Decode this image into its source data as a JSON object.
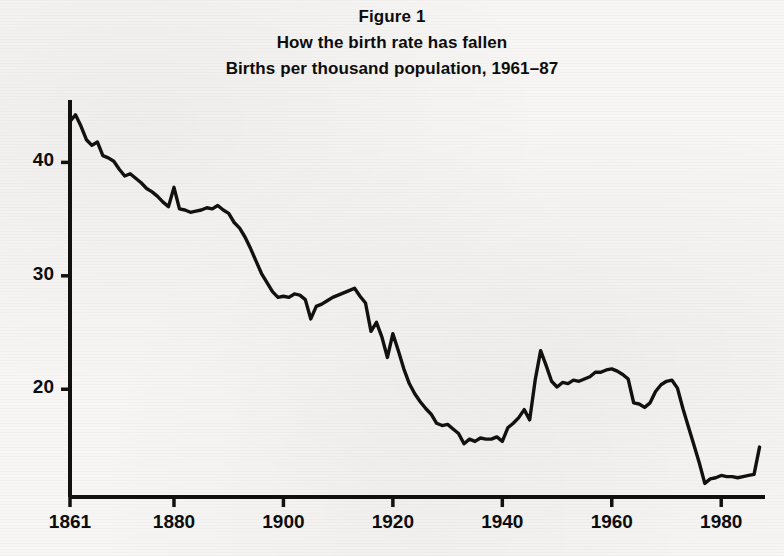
{
  "figure": {
    "title_lines": [
      "Figure 1",
      "How the birth rate has fallen",
      "Births per thousand population, 1961–87"
    ]
  },
  "axes": {
    "y_tick_labels": [
      "40",
      "30",
      "20"
    ],
    "x_tick_labels": [
      "1861",
      "1880",
      "1900",
      "1920",
      "1940",
      "1960",
      "1980"
    ]
  },
  "chart_data": {
    "type": "line",
    "subtitle": "Births per thousand population, 1961–87",
    "xlabel": "",
    "ylabel": "",
    "xlim": [
      1861,
      1988
    ],
    "ylim": [
      10.5,
      45.5
    ],
    "xticks": [
      1861,
      1880,
      1900,
      1920,
      1940,
      1960,
      1980
    ],
    "yticks": [
      20,
      30,
      40
    ],
    "grid": false,
    "legend": null,
    "line_color": "#111111",
    "series": [
      {
        "name": "Births per thousand population",
        "x": [
          1861,
          1862,
          1863,
          1864,
          1865,
          1866,
          1867,
          1868,
          1869,
          1870,
          1871,
          1872,
          1873,
          1874,
          1875,
          1876,
          1877,
          1878,
          1879,
          1880,
          1881,
          1882,
          1883,
          1884,
          1885,
          1886,
          1887,
          1888,
          1889,
          1890,
          1891,
          1892,
          1893,
          1894,
          1895,
          1896,
          1897,
          1898,
          1899,
          1900,
          1901,
          1902,
          1903,
          1904,
          1905,
          1906,
          1907,
          1908,
          1909,
          1910,
          1911,
          1912,
          1913,
          1914,
          1915,
          1916,
          1917,
          1918,
          1919,
          1920,
          1921,
          1922,
          1923,
          1924,
          1925,
          1926,
          1927,
          1928,
          1929,
          1930,
          1931,
          1932,
          1933,
          1934,
          1935,
          1936,
          1937,
          1938,
          1939,
          1940,
          1941,
          1942,
          1943,
          1944,
          1945,
          1946,
          1947,
          1948,
          1949,
          1950,
          1951,
          1952,
          1953,
          1954,
          1955,
          1956,
          1957,
          1958,
          1959,
          1960,
          1961,
          1962,
          1963,
          1964,
          1965,
          1966,
          1967,
          1968,
          1969,
          1970,
          1971,
          1972,
          1973,
          1974,
          1975,
          1976,
          1977,
          1978,
          1979,
          1980,
          1981,
          1982,
          1983,
          1984,
          1985,
          1986,
          1987
        ],
        "y": [
          43.6,
          44.2,
          43.2,
          42.0,
          41.5,
          41.8,
          40.6,
          40.4,
          40.1,
          39.4,
          38.8,
          39.0,
          38.6,
          38.2,
          37.7,
          37.4,
          37.0,
          36.5,
          36.1,
          37.8,
          35.9,
          35.8,
          35.6,
          35.7,
          35.8,
          36.0,
          35.9,
          36.2,
          35.8,
          35.5,
          34.7,
          34.2,
          33.4,
          32.4,
          31.3,
          30.2,
          29.4,
          28.6,
          28.1,
          28.2,
          28.1,
          28.4,
          28.3,
          27.9,
          26.2,
          27.3,
          27.5,
          27.8,
          28.1,
          28.3,
          28.5,
          28.7,
          28.9,
          28.2,
          27.6,
          25.1,
          25.9,
          24.6,
          22.8,
          24.9,
          23.4,
          21.8,
          20.5,
          19.6,
          18.9,
          18.3,
          17.8,
          17.0,
          16.8,
          16.9,
          16.5,
          16.1,
          15.2,
          15.6,
          15.4,
          15.7,
          15.6,
          15.6,
          15.8,
          15.4,
          16.6,
          17.0,
          17.5,
          18.2,
          17.3,
          20.8,
          23.4,
          22.1,
          20.7,
          20.2,
          20.6,
          20.5,
          20.8,
          20.7,
          20.9,
          21.1,
          21.5,
          21.5,
          21.7,
          21.8,
          21.6,
          21.3,
          20.9,
          18.8,
          18.7,
          18.4,
          18.8,
          19.8,
          20.4,
          20.7,
          20.8,
          20.1,
          18.3,
          16.7,
          15.1,
          13.5,
          11.7,
          12.1,
          12.2,
          12.4,
          12.3,
          12.3,
          12.2,
          12.3,
          12.4,
          12.5,
          14.9
        ]
      }
    ]
  }
}
